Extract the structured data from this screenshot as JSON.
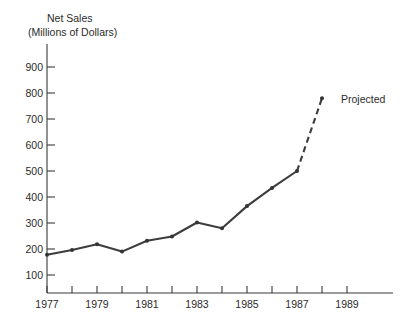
{
  "chart_data": {
    "type": "line",
    "title": "Net Sales",
    "subtitle": "(Millions of Dollars)",
    "xlabel": "",
    "ylabel": "",
    "x": [
      1977,
      1978,
      1979,
      1980,
      1981,
      1982,
      1983,
      1984,
      1985,
      1986,
      1987,
      1988
    ],
    "values": [
      178,
      196,
      218,
      190,
      232,
      248,
      302,
      280,
      365,
      435,
      500,
      780
    ],
    "series": [
      {
        "name": "Actual",
        "x": [
          1977,
          1978,
          1979,
          1980,
          1981,
          1982,
          1983,
          1984,
          1985,
          1986,
          1987
        ],
        "values": [
          178,
          196,
          218,
          190,
          232,
          248,
          302,
          280,
          365,
          435,
          500
        ],
        "style": "solid"
      },
      {
        "name": "Projected",
        "x": [
          1987,
          1988
        ],
        "values": [
          500,
          780
        ],
        "style": "dashed"
      }
    ],
    "annotations": [
      {
        "text": "Projected",
        "x": 1988,
        "y": 780
      }
    ],
    "xlim": [
      1977,
      1990
    ],
    "ylim": [
      0,
      950
    ],
    "y_ticks": [
      100,
      200,
      300,
      400,
      500,
      600,
      700,
      800,
      900
    ],
    "y_tick_labels": [
      "100",
      "200",
      "300",
      "400",
      "500",
      "600",
      "700",
      "800",
      "900"
    ],
    "x_ticks": [
      1977,
      1978,
      1979,
      1980,
      1981,
      1982,
      1983,
      1984,
      1985,
      1986,
      1987,
      1988,
      1989
    ],
    "x_tick_labels": [
      "1977",
      "",
      "1979",
      "",
      "1981",
      "",
      "1983",
      "",
      "1985",
      "",
      "1987",
      "",
      "1989"
    ],
    "grid": false,
    "legend": "none",
    "line_color": "#3d3d3d",
    "axis_color": "#3a3a3a",
    "text_color": "#2b2b2b",
    "background": "#ffffff"
  }
}
